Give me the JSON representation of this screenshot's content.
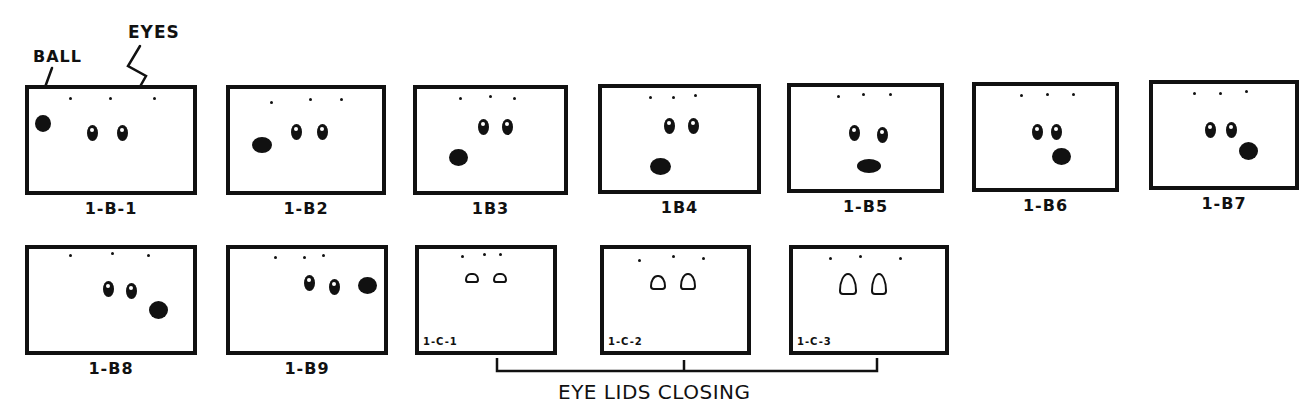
{
  "annotations": {
    "ball_label": "BALL",
    "eyes_label": "EYES"
  },
  "rows": [
    {
      "panels": [
        {
          "id": "1-B-1",
          "label": "1-B-1",
          "x": 25,
          "y": 85,
          "w": 172,
          "h": 110,
          "dots": [
            [
              40,
              8
            ],
            [
              80,
              8
            ],
            [
              124,
              8
            ]
          ],
          "eyes": [
            [
              58,
              36
            ],
            [
              88,
              36
            ]
          ],
          "ball": [
            6,
            26,
            16,
            17
          ]
        },
        {
          "id": "1-B2",
          "label": "1-B2",
          "x": 226,
          "y": 85,
          "w": 160,
          "h": 110,
          "dots": [
            [
              40,
              12
            ],
            [
              79,
              9
            ],
            [
              110,
              9
            ]
          ],
          "eyes": [
            [
              61,
              35
            ],
            [
              87,
              35
            ]
          ],
          "ball": [
            22,
            48,
            20,
            16
          ]
        },
        {
          "id": "1B3",
          "label": "1B3",
          "x": 413,
          "y": 85,
          "w": 155,
          "h": 110,
          "dots": [
            [
              42,
              8
            ],
            [
              72,
              6
            ],
            [
              96,
              8
            ]
          ],
          "eyes": [
            [
              61,
              30
            ],
            [
              85,
              30
            ]
          ],
          "ball": [
            32,
            60,
            19,
            17
          ]
        },
        {
          "id": "1B4",
          "label": "1B4",
          "x": 598,
          "y": 84,
          "w": 163,
          "h": 110,
          "dots": [
            [
              47,
              8
            ],
            [
              70,
              8
            ],
            [
              92,
              6
            ]
          ],
          "eyes": [
            [
              62,
              30
            ],
            [
              86,
              30
            ]
          ],
          "ball": [
            48,
            70,
            21,
            17
          ]
        },
        {
          "id": "1-B5",
          "label": "1-B5",
          "x": 787,
          "y": 83,
          "w": 157,
          "h": 110,
          "dots": [
            [
              46,
              8
            ],
            [
              71,
              6
            ],
            [
              98,
              6
            ]
          ],
          "eyes": [
            [
              58,
              38
            ],
            [
              86,
              40
            ]
          ],
          "ball": [
            66,
            72,
            24,
            14
          ]
        },
        {
          "id": "1-B6",
          "label": "1-B6",
          "x": 972,
          "y": 82,
          "w": 147,
          "h": 110,
          "dots": [
            [
              44,
              8
            ],
            [
              70,
              7
            ],
            [
              96,
              7
            ]
          ],
          "eyes": [
            [
              56,
              38
            ],
            [
              75,
              38
            ]
          ],
          "ball": [
            76,
            62,
            19,
            17
          ]
        },
        {
          "id": "1-B7",
          "label": "1-B7",
          "x": 1149,
          "y": 80,
          "w": 150,
          "h": 110,
          "dots": [
            [
              40,
              8
            ],
            [
              66,
              8
            ],
            [
              92,
              6
            ]
          ],
          "eyes": [
            [
              52,
              38
            ],
            [
              73,
              38
            ]
          ],
          "ball": [
            86,
            58,
            19,
            18
          ]
        }
      ]
    },
    {
      "panels": [
        {
          "id": "1-B8",
          "label": "1-B8",
          "x": 25,
          "y": 245,
          "w": 172,
          "h": 110,
          "dots": [
            [
              40,
              5
            ],
            [
              82,
              3
            ],
            [
              118,
              5
            ]
          ],
          "eyes": [
            [
              74,
              32
            ],
            [
              97,
              34
            ]
          ],
          "ball": [
            120,
            52,
            19,
            18
          ]
        },
        {
          "id": "1-B9",
          "label": "1-B9",
          "x": 226,
          "y": 245,
          "w": 162,
          "h": 110,
          "dots": [
            [
              44,
              7
            ],
            [
              73,
              7
            ],
            [
              92,
              5
            ]
          ],
          "eyes": [
            [
              74,
              26
            ],
            [
              99,
              30
            ]
          ],
          "ball": [
            128,
            28,
            19,
            17
          ]
        }
      ],
      "lid_panels": [
        {
          "id": "1-C-1",
          "label": "1-C-1",
          "x": 415,
          "y": 245,
          "w": 142,
          "h": 110,
          "dots": [
            [
              42,
              6
            ],
            [
              64,
              4
            ],
            [
              80,
              4
            ]
          ],
          "lids": [
            [
              46,
              24,
              14,
              10
            ],
            [
              74,
              24,
              14,
              10
            ]
          ]
        },
        {
          "id": "1-C-2",
          "label": "1-C-2",
          "x": 600,
          "y": 245,
          "w": 151,
          "h": 110,
          "dots": [
            [
              34,
              10
            ],
            [
              68,
              6
            ],
            [
              98,
              8
            ]
          ],
          "lids": [
            [
              46,
              26,
              16,
              15
            ],
            [
              76,
              24,
              16,
              17
            ]
          ]
        },
        {
          "id": "1-C-3",
          "label": "1-C-3",
          "x": 789,
          "y": 245,
          "w": 160,
          "h": 110,
          "dots": [
            [
              36,
              8
            ],
            [
              66,
              6
            ],
            [
              106,
              8
            ]
          ],
          "lids": [
            [
              46,
              24,
              18,
              22
            ],
            [
              78,
              24,
              16,
              22
            ]
          ]
        }
      ]
    }
  ],
  "bracket": {
    "label": "EYE LIDS CLOSING",
    "x1": 497,
    "x2": 877,
    "mid": 684,
    "y": 370
  },
  "colors": {
    "ink": "#111111",
    "paper": "#ffffff"
  }
}
